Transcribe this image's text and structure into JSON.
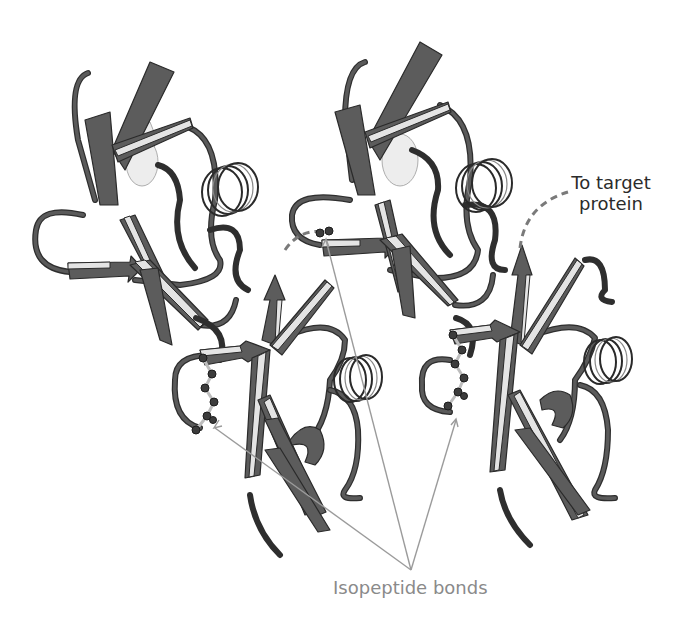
{
  "figure": {
    "subunit_count": 4,
    "colors": {
      "strand_fill": "#5c5c5c",
      "strand_edge": "#e4e4e4",
      "outline": "#2a2a2a",
      "annotation_line": "#9b9b9b",
      "annotation_text": "#8a8a8a",
      "label_text": "#2b2b2b"
    }
  },
  "labels": {
    "target": "To target protein",
    "target_line1": "To target",
    "target_line2": "protein",
    "bonds": "Isopeptide bonds"
  },
  "annotations": {
    "bond_arrow_count": 3,
    "target_connector": "dashed-line"
  }
}
